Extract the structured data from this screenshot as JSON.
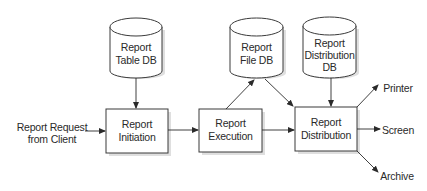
{
  "diagram": {
    "type": "flowchart",
    "databases": [
      {
        "id": "report-table-db",
        "lines": [
          "Report",
          "Table DB"
        ]
      },
      {
        "id": "report-file-db",
        "lines": [
          "Report",
          "File DB"
        ]
      },
      {
        "id": "report-distribution-db",
        "lines": [
          "Report",
          "Distribution",
          "DB"
        ]
      }
    ],
    "processes": [
      {
        "id": "report-initiation",
        "lines": [
          "Report",
          "Initiation"
        ]
      },
      {
        "id": "report-execution",
        "lines": [
          "Report",
          "Execution"
        ]
      },
      {
        "id": "report-distribution",
        "lines": [
          "Report",
          "Distribution"
        ]
      }
    ],
    "input": {
      "id": "report-request",
      "lines": [
        "Report Request",
        "from Client"
      ]
    },
    "outputs": [
      {
        "id": "printer",
        "label": "Printer"
      },
      {
        "id": "screen",
        "label": "Screen"
      },
      {
        "id": "archive",
        "label": "Archive"
      }
    ],
    "edges": [
      {
        "from": "report-request",
        "to": "report-initiation"
      },
      {
        "from": "report-table-db",
        "to": "report-initiation"
      },
      {
        "from": "report-initiation",
        "to": "report-execution"
      },
      {
        "from": "report-execution",
        "to": "report-file-db"
      },
      {
        "from": "report-execution",
        "to": "report-distribution"
      },
      {
        "from": "report-file-db",
        "to": "report-distribution"
      },
      {
        "from": "report-distribution-db",
        "to": "report-distribution"
      },
      {
        "from": "report-distribution",
        "to": "printer"
      },
      {
        "from": "report-distribution",
        "to": "screen"
      },
      {
        "from": "report-distribution",
        "to": "archive"
      }
    ]
  }
}
